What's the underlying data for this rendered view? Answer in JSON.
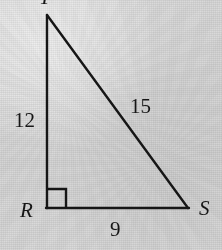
{
  "figure": {
    "type": "right-triangle",
    "canvas": {
      "width": 222,
      "height": 250
    },
    "background_color": "#d6d6d6",
    "stroke_color": "#161616",
    "stroke_width": 2.4,
    "vertices": [
      {
        "id": "top",
        "label": "T",
        "x": 47,
        "y": 15,
        "label_clipped_at_top": true
      },
      {
        "id": "left",
        "label": "R",
        "x": 47,
        "y": 208,
        "right_angle": true
      },
      {
        "id": "right",
        "label": "S",
        "x": 188,
        "y": 208
      }
    ],
    "sides": [
      {
        "id": "vertical-leg",
        "from": "top",
        "to": "left",
        "label": "12"
      },
      {
        "id": "hypotenuse",
        "from": "top",
        "to": "right",
        "label": "15"
      },
      {
        "id": "horizontal-leg",
        "from": "left",
        "to": "right",
        "label": "9"
      }
    ],
    "right_angle_marker": {
      "at_vertex": "left",
      "size": 19,
      "x": 47,
      "y": 189
    }
  }
}
